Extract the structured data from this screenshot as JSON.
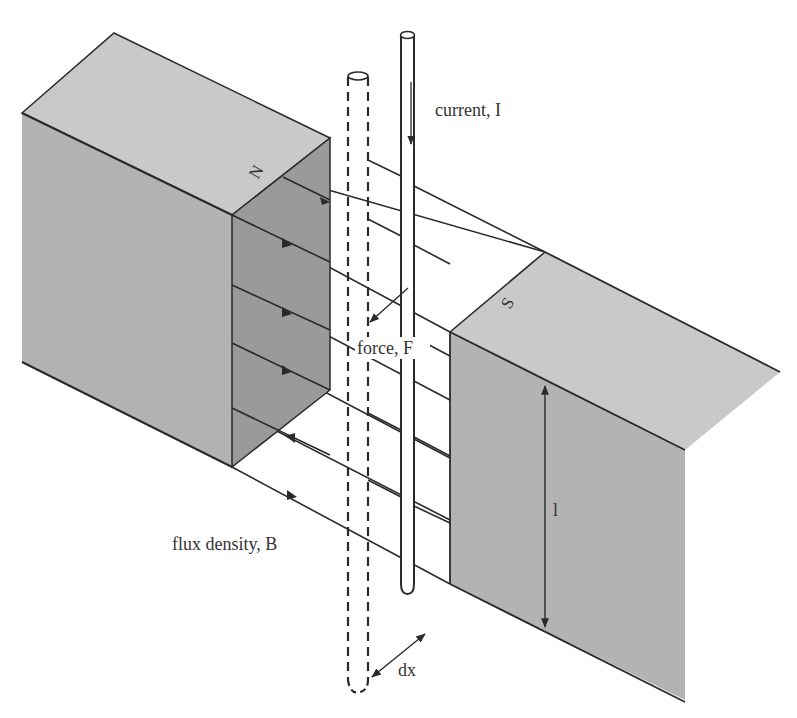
{
  "diagram": {
    "type": "physics-illustration",
    "labels": {
      "current": "current, I",
      "force": "force, F",
      "flux": "flux density, B",
      "length": "l",
      "displacement": "dx",
      "north_pole": "N",
      "south_pole": "S"
    },
    "colors": {
      "background": "#ffffff",
      "magnet_top": "#c8c8c8",
      "magnet_front": "#b4b4b4",
      "magnet_inner": "#999999",
      "line": "#2a2a2a",
      "text": "#333333"
    }
  }
}
